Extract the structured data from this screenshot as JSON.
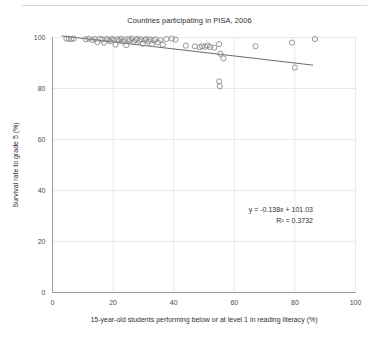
{
  "chart_data": {
    "type": "scatter",
    "title": "Countries participating in PISA, 2006",
    "xlabel": "15-year-old students performing below or at level 1 in reading literacy (%)",
    "ylabel": "Survival rate to grade 5 (%)",
    "xlim": [
      0,
      100
    ],
    "ylim": [
      0,
      100
    ],
    "xticks": [
      0,
      20,
      40,
      60,
      80,
      100
    ],
    "yticks": [
      0,
      20,
      40,
      60,
      80,
      100
    ],
    "xtick_labels": [
      "0",
      "20",
      "40",
      "60",
      "80",
      "100"
    ],
    "ytick_labels": [
      "0",
      "20",
      "40",
      "60",
      "80",
      "100"
    ],
    "grid": true,
    "legend": false,
    "marker_style": "open-circle",
    "marker_color": "#8a8a8a",
    "trendline": {
      "equation_label": "y = -0.138x + 101.03",
      "r2_label": "R² = 0.3732",
      "slope": -0.138,
      "intercept": 101.03,
      "r_squared": 0.3732,
      "x_start": 3,
      "x_end": 86,
      "color": "#6b6b6b"
    },
    "points": [
      [
        4.6,
        99.6
      ],
      [
        5.4,
        99.5
      ],
      [
        6.2,
        99.4
      ],
      [
        7.0,
        99.6
      ],
      [
        11.0,
        99.3
      ],
      [
        12.0,
        99.5
      ],
      [
        13.2,
        99.0
      ],
      [
        14.0,
        99.4
      ],
      [
        14.8,
        98.2
      ],
      [
        15.6,
        99.5
      ],
      [
        16.4,
        99.2
      ],
      [
        17.0,
        98.0
      ],
      [
        17.8,
        99.4
      ],
      [
        18.4,
        99.1
      ],
      [
        19.0,
        98.6
      ],
      [
        19.6,
        99.5
      ],
      [
        20.2,
        99.0
      ],
      [
        20.8,
        97.2
      ],
      [
        21.4,
        99.3
      ],
      [
        22.0,
        98.8
      ],
      [
        22.6,
        99.5
      ],
      [
        23.2,
        98.4
      ],
      [
        23.8,
        99.2
      ],
      [
        24.4,
        97.0
      ],
      [
        25.0,
        99.4
      ],
      [
        25.6,
        98.9
      ],
      [
        26.2,
        99.6
      ],
      [
        26.8,
        98.3
      ],
      [
        27.4,
        99.1
      ],
      [
        28.0,
        99.5
      ],
      [
        28.6,
        98.7
      ],
      [
        29.2,
        99.3
      ],
      [
        29.8,
        97.6
      ],
      [
        30.4,
        99.0
      ],
      [
        31.0,
        99.4
      ],
      [
        31.6,
        98.5
      ],
      [
        32.2,
        99.2
      ],
      [
        32.8,
        97.4
      ],
      [
        33.4,
        98.9
      ],
      [
        34.0,
        99.3
      ],
      [
        34.8,
        98.1
      ],
      [
        35.6,
        99.0
      ],
      [
        36.4,
        97.2
      ],
      [
        37.6,
        99.4
      ],
      [
        39.4,
        99.6
      ],
      [
        40.6,
        99.2
      ],
      [
        44.0,
        96.8
      ],
      [
        47.0,
        96.5
      ],
      [
        48.6,
        96.2
      ],
      [
        49.4,
        96.6
      ],
      [
        50.4,
        96.4
      ],
      [
        51.2,
        96.9
      ],
      [
        52.0,
        96.3
      ],
      [
        53.4,
        96.0
      ],
      [
        55.0,
        97.4
      ],
      [
        55.4,
        93.6
      ],
      [
        56.4,
        91.8
      ],
      [
        55.0,
        82.8
      ],
      [
        55.2,
        80.9
      ],
      [
        67.0,
        96.6
      ],
      [
        79.0,
        98.0
      ],
      [
        80.0,
        88.2
      ],
      [
        86.6,
        99.4
      ]
    ]
  }
}
